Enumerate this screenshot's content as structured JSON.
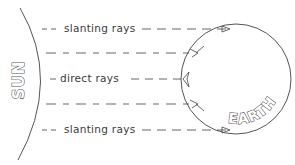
{
  "diagram": {
    "sun": {
      "label": "SUN"
    },
    "earth": {
      "label": "EARTH"
    },
    "rays": [
      {
        "id": "top-slanting",
        "label": "slanting rays",
        "y": 28
      },
      {
        "id": "upper-unlabeled",
        "label": "",
        "y": 53
      },
      {
        "id": "direct",
        "label": "direct rays",
        "y": 79
      },
      {
        "id": "lower-unlabeled",
        "label": "",
        "y": 104
      },
      {
        "id": "bottom-slanting",
        "label": "slanting rays",
        "y": 130
      }
    ],
    "colors": {
      "line": "#555555",
      "text": "#3a3a3a",
      "background": "#ffffff"
    }
  }
}
